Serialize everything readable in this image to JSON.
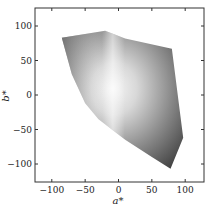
{
  "chart_data": {
    "type": "area",
    "title": "",
    "xlabel": "a*",
    "ylabel": "b*",
    "xlim": [
      -125,
      127
    ],
    "ylim": [
      -127,
      128
    ],
    "xticks": [
      -100,
      -50,
      0,
      50,
      100
    ],
    "yticks": [
      100,
      50,
      0,
      -50,
      -100
    ],
    "xtick_labels": [
      "−100",
      "−50",
      "0",
      "50",
      "100"
    ],
    "ytick_labels": [
      "100",
      "50",
      "0",
      "−50",
      "−100"
    ],
    "grid": false,
    "legend": null,
    "series": [
      {
        "name": "gamut boundary (a*, b*)",
        "shape": "filled polygon with grayscale gradient",
        "x": [
          -85,
          -20,
          10,
          80,
          97,
          78,
          50,
          10,
          -30,
          -50,
          -70,
          -85
        ],
        "y": [
          83,
          93,
          82,
          67,
          -62,
          -107,
          -90,
          -65,
          -35,
          -12,
          30,
          83
        ]
      }
    ],
    "caption": ""
  },
  "axes": {
    "x_label": "a*",
    "y_label": "b*",
    "x_ticks": [
      {
        "label": "−100"
      },
      {
        "label": "−50"
      },
      {
        "label": "0"
      },
      {
        "label": "50"
      },
      {
        "label": "100"
      }
    ],
    "y_ticks": [
      {
        "label": "100"
      },
      {
        "label": "50"
      },
      {
        "label": "0"
      },
      {
        "label": "−50"
      },
      {
        "label": "−100"
      }
    ]
  },
  "colors": {
    "frame": "#333333",
    "fill_light": "#f2f2f2",
    "fill_mid": "#9a9a9a",
    "fill_dark": "#3c3c3c"
  }
}
